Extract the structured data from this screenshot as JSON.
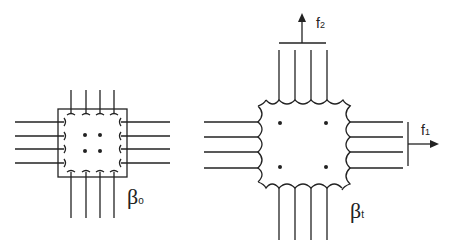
{
  "figure": {
    "left_panel": {
      "label_symbol": "β",
      "label_subscript": "o",
      "fibers_per_side": 4,
      "inner_dots": 4
    },
    "right_panel": {
      "label_symbol": "β",
      "label_subscript": "t",
      "fibers_per_side": 4,
      "inner_dots": 4,
      "force_vertical": {
        "symbol": "f",
        "subscript": "2"
      },
      "force_horizontal": {
        "symbol": "f",
        "subscript": "1"
      }
    },
    "colors": {
      "stroke": "#222222",
      "background": "#ffffff"
    }
  }
}
